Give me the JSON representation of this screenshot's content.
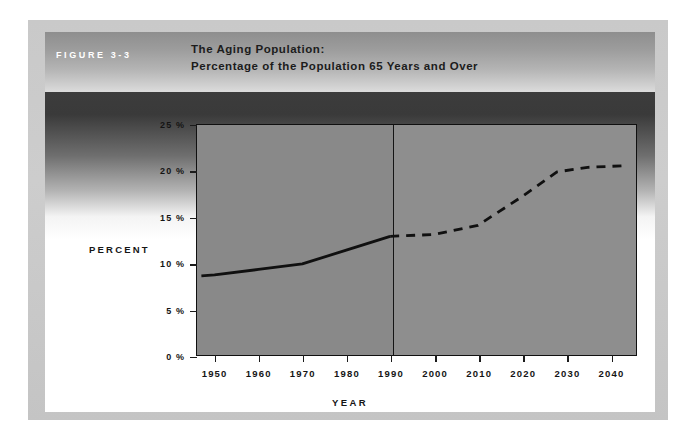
{
  "figure": {
    "label": "FIGURE 3-3",
    "title_line1": "The Aging Population:",
    "title_line2": "Percentage of the Population 65 Years and Over"
  },
  "chart_data": {
    "type": "line",
    "title": "The Aging Population: Percentage of the Population 65 Years and Over",
    "xlabel": "YEAR",
    "ylabel": "PERCENT",
    "xlim": [
      1946,
      2046
    ],
    "ylim": [
      0,
      25
    ],
    "grid": false,
    "legend": null,
    "x_tick_labels": [
      "1950",
      "1960",
      "1970",
      "1980",
      "1990",
      "2000",
      "2010",
      "2020",
      "2030",
      "2040"
    ],
    "x_tick_values": [
      1950,
      1960,
      1970,
      1980,
      1990,
      2000,
      2010,
      2020,
      2030,
      2040
    ],
    "y_tick_labels": [
      "0 %",
      "5 %",
      "10 %",
      "15 %",
      "20 %",
      "25 %"
    ],
    "y_tick_values": [
      0,
      5,
      10,
      15,
      20,
      25
    ],
    "annotations": [
      {
        "name": "projection-divider",
        "x": 1990,
        "note": "vertical rule separating actual data from projection"
      }
    ],
    "series": [
      {
        "name": "Actual",
        "style": "solid",
        "color": "#101010",
        "x": [
          1947,
          1950,
          1960,
          1970,
          1980,
          1990
        ],
        "values": [
          8.6,
          8.7,
          9.3,
          9.9,
          11.4,
          12.9
        ]
      },
      {
        "name": "Projected",
        "style": "dashed",
        "color": "#101010",
        "x": [
          1990,
          2000,
          2010,
          2020,
          2028,
          2035,
          2040,
          2044
        ],
        "values": [
          12.9,
          13.1,
          14.1,
          17.2,
          19.9,
          20.4,
          20.5,
          20.6
        ]
      }
    ]
  }
}
